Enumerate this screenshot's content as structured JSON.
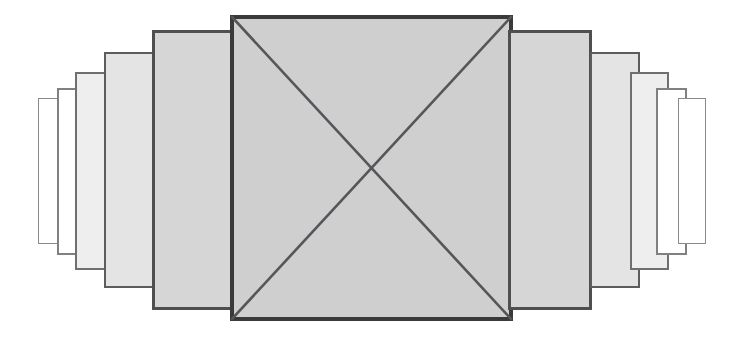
{
  "figure": {
    "title": "Nested telescoping rectangles with diagonal cross",
    "canvas": {
      "width": 734,
      "height": 338,
      "background": "#ffffff"
    },
    "palette": {
      "stroke_dark": "#4a4a4a",
      "stroke_mid": "#6b6b6b",
      "stroke_light": "#8a8a8a",
      "fill_mid_gray": "#cfcfcf",
      "fill_light_gray": "#dcdcdc",
      "fill_lighter_gray": "#e8e8e8",
      "fill_white": "#ffffff",
      "diagonal_color": "#55555a"
    },
    "rectangles": [
      {
        "name": "left-step-5-outermost",
        "side": "left",
        "order": 1,
        "x": 38,
        "y": 98,
        "width": 28,
        "height": 146,
        "fill": "#ffffff",
        "stroke": "#8a8a8a",
        "stroke_width": 1.4
      },
      {
        "name": "left-step-4",
        "side": "left",
        "order": 2,
        "x": 57,
        "y": 88,
        "width": 31,
        "height": 167,
        "fill": "#ffffff",
        "stroke": "#808080",
        "stroke_width": 1.6
      },
      {
        "name": "left-step-3",
        "side": "left",
        "order": 3,
        "x": 75,
        "y": 72,
        "width": 39,
        "height": 198,
        "fill": "#eeeeee",
        "stroke": "#6f6f6f",
        "stroke_width": 1.8
      },
      {
        "name": "left-step-2",
        "side": "left",
        "order": 4,
        "x": 104,
        "y": 52,
        "width": 50,
        "height": 236,
        "fill": "#e4e4e4",
        "stroke": "#5c5c5c",
        "stroke_width": 2.2
      },
      {
        "name": "left-step-1-innermost",
        "side": "left",
        "order": 5,
        "x": 152,
        "y": 30,
        "width": 84,
        "height": 280,
        "fill": "#d6d6d6",
        "stroke": "#4f4f4f",
        "stroke_width": 2.6
      },
      {
        "name": "center-main-rectangle",
        "side": "center",
        "order": 6,
        "x": 230,
        "y": 15,
        "width": 283,
        "height": 306,
        "fill": "#cfcfcf",
        "stroke": "#3a3a3a",
        "stroke_width": 4.0,
        "has_diagonals": true
      },
      {
        "name": "right-step-1-innermost",
        "side": "right",
        "order": 7,
        "x": 508,
        "y": 30,
        "width": 84,
        "height": 280,
        "fill": "#d6d6d6",
        "stroke": "#4f4f4f",
        "stroke_width": 2.6
      },
      {
        "name": "right-step-2",
        "side": "right",
        "order": 8,
        "x": 590,
        "y": 52,
        "width": 50,
        "height": 236,
        "fill": "#e4e4e4",
        "stroke": "#5c5c5c",
        "stroke_width": 2.2
      },
      {
        "name": "right-step-3",
        "side": "right",
        "order": 9,
        "x": 630,
        "y": 72,
        "width": 39,
        "height": 198,
        "fill": "#eeeeee",
        "stroke": "#6f6f6f",
        "stroke_width": 1.8
      },
      {
        "name": "right-step-4",
        "side": "right",
        "order": 10,
        "x": 656,
        "y": 88,
        "width": 31,
        "height": 167,
        "fill": "#ffffff",
        "stroke": "#808080",
        "stroke_width": 1.6
      },
      {
        "name": "right-step-5-outermost",
        "side": "right",
        "order": 11,
        "x": 678,
        "y": 98,
        "width": 28,
        "height": 146,
        "fill": "#ffffff",
        "stroke": "#8a8a8a",
        "stroke_width": 1.4
      }
    ],
    "diagonals": [
      {
        "name": "diagonal-tl-br",
        "x1": 232,
        "y1": 17,
        "x2": 511,
        "y2": 319,
        "stroke": "#55555a",
        "stroke_width": 2.6
      },
      {
        "name": "diagonal-tr-bl",
        "x1": 511,
        "y1": 17,
        "x2": 232,
        "y2": 319,
        "stroke": "#55555a",
        "stroke_width": 2.6
      }
    ],
    "diagonal_intersection": {
      "x": 371,
      "y": 168
    }
  }
}
